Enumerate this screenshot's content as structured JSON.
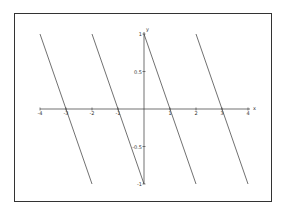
{
  "chart_data": {
    "type": "line",
    "title": "",
    "xlabel": "x",
    "ylabel": "y",
    "xlim": [
      -4,
      4
    ],
    "ylim": [
      -1,
      1
    ],
    "grid": false,
    "legend": null,
    "x_ticks": [
      -4,
      -3,
      -2,
      -1,
      1,
      2,
      3,
      4
    ],
    "x_tick_labels": [
      "-4",
      "-3",
      "-2",
      "-1",
      "1",
      "2",
      "3",
      "4"
    ],
    "y_ticks": [
      1,
      0.5,
      -0.5,
      -1
    ],
    "y_tick_labels": [
      "1",
      "0.5",
      "-0.5",
      "-1"
    ],
    "series": [
      {
        "name": "segment-1",
        "x": [
          -4,
          -2
        ],
        "y": [
          1,
          -1
        ]
      },
      {
        "name": "segment-2",
        "x": [
          -2,
          0
        ],
        "y": [
          1,
          -1
        ]
      },
      {
        "name": "segment-3",
        "x": [
          0,
          2
        ],
        "y": [
          1,
          -1
        ]
      },
      {
        "name": "segment-4",
        "x": [
          2,
          4
        ],
        "y": [
          1,
          -1
        ]
      }
    ],
    "line_color": "#333333"
  }
}
